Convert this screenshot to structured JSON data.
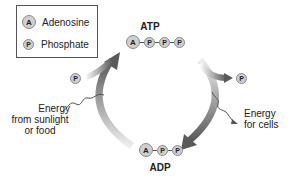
{
  "legend": {
    "items": [
      {
        "symbol": "A",
        "label": "Adenosine"
      },
      {
        "symbol": "P",
        "label": "Phosphate"
      }
    ]
  },
  "atp": {
    "label": "ATP",
    "symbols": [
      "A",
      "P",
      "P",
      "P"
    ]
  },
  "adp": {
    "label": "ADP",
    "symbols": [
      "A",
      "P",
      "P"
    ]
  },
  "input": {
    "phosphate": "P",
    "energy_label_lines": [
      "Energy",
      "from sunlight",
      "or food"
    ]
  },
  "output": {
    "phosphate": "P",
    "energy_label_lines": [
      "Energy",
      "for cells"
    ]
  },
  "colors": {
    "arrow_dark": "#5a5a5a",
    "arrow_light": "#d8d8d8",
    "circle_fill": "#cfcfcf"
  }
}
